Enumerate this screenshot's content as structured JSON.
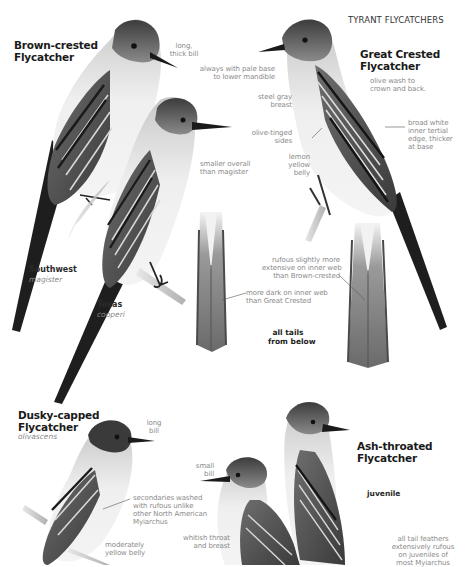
{
  "header": {
    "section_title": "TYRANT FLYCATCHERS"
  },
  "species": [
    {
      "name_line1": "Brown-crested",
      "name_line2": "Flycatcher",
      "forms": [
        {
          "label": "Southwest",
          "subspecies": "magister"
        },
        {
          "label": "Texas",
          "subspecies": "cooperi"
        }
      ],
      "annotations": [
        {
          "text_line1": "long,",
          "text_line2": "thick bill"
        },
        {
          "text_line1": "smaller overall",
          "text_line2": "than magister"
        }
      ]
    },
    {
      "name_line1": "Great Crested",
      "name_line2": "Flycatcher",
      "annotations": [
        {
          "text_line1": "always with pale base",
          "text_line2": "to lower mandible"
        },
        {
          "text_line1": "steel gray",
          "text_line2": "breast"
        },
        {
          "text_line1": "olive-tinged",
          "text_line2": "sides"
        },
        {
          "text_line1": "lemon",
          "text_line2": "yellow",
          "text_line3": "belly"
        },
        {
          "text_line1": "olive wash to",
          "text_line2": "crown and back."
        },
        {
          "text_line1": "broad white",
          "text_line2": "inner tertial",
          "text_line3": "edge, thicker",
          "text_line4": "at base"
        }
      ]
    },
    {
      "name_line1": "Dusky-capped",
      "name_line2": "Flycatcher",
      "subspecies": "olivascens",
      "annotations": [
        {
          "text_line1": "long",
          "text_line2": "bill"
        },
        {
          "text_line1": "secondaries washed",
          "text_line2": "with rufous unlike",
          "text_line3": "other North American",
          "text_line4": "Myiarchus"
        },
        {
          "text_line1": "moderately",
          "text_line2": "yellow belly"
        }
      ]
    },
    {
      "name_line1": "Ash-throated",
      "name_line2": "Flycatcher",
      "age_label": "juvenile",
      "annotations": [
        {
          "text_line1": "small",
          "text_line2": "bill"
        },
        {
          "text_line1": "whitish throat",
          "text_line2": "and breast"
        },
        {
          "text_line1": "all tail feathers",
          "text_line2": "extensively rufous",
          "text_line3": "on juveniles of",
          "text_line4": "most Myiarchus"
        }
      ]
    }
  ],
  "tails": {
    "caption_line1": "all tails",
    "caption_line2": "from below",
    "brown_crested_note": {
      "text_line1": "more dark on inner web",
      "text_line2": "than Great Crested"
    },
    "great_crested_note": {
      "text_line1": "rufous slightly more",
      "text_line2": "extensive on inner web",
      "text_line3": "than Brown-crested"
    }
  },
  "colors": {
    "title_text": "#1a1a1a",
    "annotation_text": "#8a8a8a",
    "leader_line": "#555555"
  }
}
